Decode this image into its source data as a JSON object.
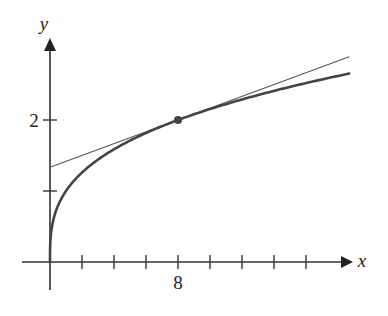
{
  "chart_data": {
    "type": "line",
    "title": "",
    "xlabel": "x",
    "ylabel": "y",
    "x_ticks": [
      2,
      4,
      6,
      8,
      10,
      12,
      14,
      16
    ],
    "x_tick_labels": [
      {
        "value": 8,
        "label": "8"
      }
    ],
    "y_ticks": [
      1,
      2
    ],
    "y_tick_labels": [
      {
        "value": 2,
        "label": "2"
      }
    ],
    "xlim": [
      0,
      18.7
    ],
    "ylim": [
      0,
      3.1
    ],
    "grid": false,
    "legend": null,
    "series": [
      {
        "name": "curve y = cube root of x",
        "style": "thick",
        "x": [
          0,
          0.05,
          0.25,
          0.5,
          1,
          2,
          3,
          4,
          6,
          8,
          10,
          12,
          14,
          16,
          18.7
        ],
        "y": [
          0,
          0.368,
          0.63,
          0.794,
          1,
          1.26,
          1.442,
          1.587,
          1.817,
          2,
          2.154,
          2.289,
          2.41,
          2.52,
          2.654
        ]
      },
      {
        "name": "tangent line at (8, 2)",
        "style": "thin",
        "x": [
          0,
          18.7
        ],
        "y": [
          1.333,
          2.892
        ]
      }
    ],
    "annotations": [
      {
        "type": "point",
        "x": 8,
        "y": 2,
        "label": "point of tangency"
      }
    ]
  },
  "axes": {
    "x_label": "x",
    "y_label": "y",
    "x_tick_8_label": "8",
    "y_tick_2_label": "2"
  },
  "colors": {
    "axis": "#333333",
    "curve": "#444444",
    "tangent": "#555555",
    "point": "#444444"
  }
}
